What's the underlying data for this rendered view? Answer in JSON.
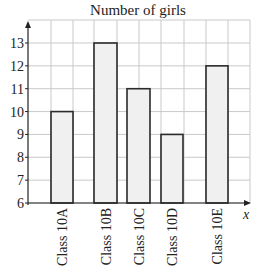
{
  "chart_data": {
    "type": "bar",
    "title": "Number of girls",
    "xlabel": "x",
    "ylabel": "",
    "categories": [
      "Class 10A",
      "Class 10B",
      "Class 10C",
      "Class 10D",
      "Class 10E"
    ],
    "values": [
      10,
      13,
      11,
      9,
      12
    ],
    "yticks": [
      6,
      7,
      8,
      9,
      10,
      11,
      12,
      13
    ],
    "ylim": [
      6,
      13.9
    ],
    "grid": true,
    "legend": null,
    "colors": {
      "bar_fill": "#f0f0f0",
      "bar_stroke": "#2a2a2a",
      "grid": "#c9c9c9",
      "axis": "#222222"
    }
  }
}
